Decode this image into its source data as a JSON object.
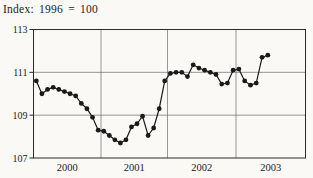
{
  "chart_data": {
    "type": "line",
    "title": "Index: 1996 = 100",
    "x_start": "2000-01",
    "x_end": "2003-06",
    "frequency": "monthly",
    "values": [
      110.6,
      110.0,
      110.2,
      110.3,
      110.2,
      110.1,
      110.0,
      109.9,
      109.55,
      109.3,
      108.9,
      108.3,
      108.25,
      108.05,
      107.85,
      107.7,
      107.85,
      108.45,
      108.6,
      108.95,
      108.05,
      108.4,
      109.3,
      110.6,
      110.95,
      111.0,
      111.0,
      110.8,
      111.35,
      111.2,
      111.1,
      111.0,
      110.9,
      110.45,
      110.5,
      111.1,
      111.15,
      110.6,
      110.4,
      110.5,
      111.7,
      111.8
    ],
    "x_tick_labels": [
      "2000",
      "2001",
      "2002",
      "2003"
    ],
    "y_ticks": [
      113,
      111,
      109,
      107
    ],
    "y_gridlines": [
      111,
      109
    ],
    "ylim": [
      107,
      113
    ],
    "grid": true,
    "legend": "none",
    "marker": "filled-circle",
    "colors": {
      "line": "#1a1a1a",
      "marker": "#1a1a1a",
      "grid": "#6b6b6b",
      "axis": "#2a2a2a",
      "text": "#1b1b1b",
      "background": "#faf9f6"
    }
  }
}
